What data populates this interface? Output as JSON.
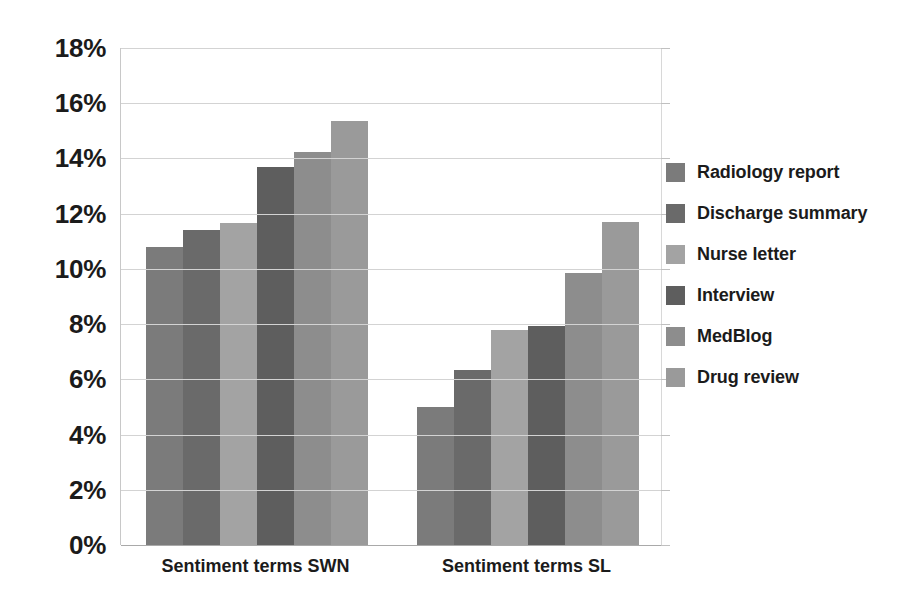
{
  "chart_data": {
    "type": "bar",
    "title": "",
    "subtitle": "",
    "xlabel": "",
    "ylabel": "",
    "categories": [
      "Sentiment terms SWN",
      "Sentiment terms SL"
    ],
    "series": [
      {
        "name": "Radiology report",
        "color": "#7b7b7b",
        "values": [
          10.8,
          5.0
        ]
      },
      {
        "name": "Discharge summary",
        "color": "#6a6a6a",
        "values": [
          11.4,
          6.35
        ]
      },
      {
        "name": "Nurse letter",
        "color": "#a3a3a3",
        "values": [
          11.65,
          7.8
        ]
      },
      {
        "name": "Interview",
        "color": "#5e5e5e",
        "values": [
          13.7,
          7.95
        ]
      },
      {
        "name": "MedBlog",
        "color": "#8d8d8d",
        "values": [
          14.25,
          9.85
        ]
      },
      {
        "name": "Drug review",
        "color": "#9a9a9a",
        "values": [
          15.35,
          11.7
        ]
      }
    ],
    "ylim": [
      0,
      18
    ],
    "ytick_step": 2,
    "ytick_labels": [
      "0%",
      "2%",
      "4%",
      "6%",
      "8%",
      "10%",
      "12%",
      "14%",
      "16%",
      "18%"
    ],
    "value_suffix": "%",
    "grid": true,
    "grid_axis": "y",
    "legend_position": "right",
    "bar_gap": 0,
    "background_color": "#ffffff",
    "grid_color": "#d3d3d3",
    "text_color": "#1b1b1b"
  }
}
